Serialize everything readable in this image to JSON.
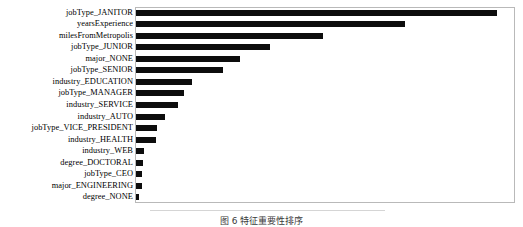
{
  "figure": {
    "caption": "图 6  特征重要性排序",
    "background_color": "#ffffff",
    "bar_color": "#0d0d0d",
    "frame_color": "#b9b9b9"
  },
  "chart_data": {
    "type": "bar",
    "orientation": "horizontal",
    "title": "",
    "subtitle": "",
    "xlabel": "",
    "ylabel": "",
    "grid": false,
    "legend": null,
    "xlim": [
      0,
      1.0
    ],
    "categories": [
      "jobType_JANITOR",
      "yearsExperience",
      "milesFromMetropolis",
      "jobType_JUNIOR",
      "major_NONE",
      "jobType_SENIOR",
      "industry_EDUCATION",
      "jobType_MANAGER",
      "industry_SERVICE",
      "industry_AUTO",
      "jobType_VICE_PRESIDENT",
      "industry_HEALTH",
      "industry_WEB",
      "degree_DOCTORAL",
      "jobType_CEO",
      "major_ENGINEERING",
      "degree_NONE"
    ],
    "values": [
      1.0,
      0.744,
      0.517,
      0.37,
      0.287,
      0.24,
      0.155,
      0.133,
      0.116,
      0.08,
      0.058,
      0.055,
      0.022,
      0.019,
      0.018,
      0.016,
      0.008
    ],
    "bar_pixel_ends": [
      497,
      405,
      323,
      270,
      240,
      223,
      192,
      184,
      178,
      165,
      157,
      156,
      143,
      142,
      142,
      141,
      138
    ]
  }
}
